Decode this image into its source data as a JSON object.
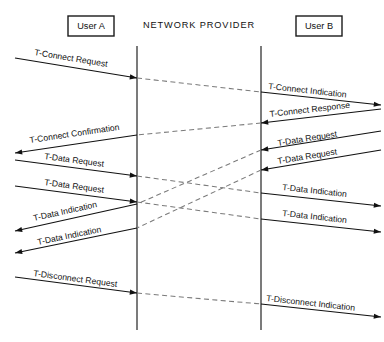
{
  "diagram": {
    "canvas": {
      "width": 384,
      "height": 342
    },
    "colors": {
      "line_solid": "#111111",
      "line_dashed": "#7a7a7a",
      "lifeline": "#5a5a5a",
      "box_stroke": "#1a1a1a",
      "background": "#ffffff"
    },
    "actors": [
      {
        "id": "user-a",
        "label": "User A",
        "box": {
          "x": 68,
          "y": 16,
          "w": 46,
          "h": 20
        }
      },
      {
        "id": "network-provider",
        "label": "NETWORK PROVIDER",
        "box": null,
        "center_x": 199,
        "center_y": 26
      },
      {
        "id": "user-b",
        "label": "User B",
        "box": {
          "x": 296,
          "y": 16,
          "w": 46,
          "h": 20
        }
      }
    ],
    "lifelines": [
      {
        "id": "provider-left-boundary",
        "x": 137,
        "y1": 46,
        "y2": 330
      },
      {
        "id": "provider-right-boundary",
        "x": 261,
        "y1": 46,
        "y2": 330
      }
    ],
    "messages": [
      {
        "id": "m1",
        "label": "T-Connect Request",
        "side": "left",
        "style": "solid",
        "direction": "to-provider",
        "x1": 15,
        "y1": 58,
        "x2": 137,
        "y2": 78,
        "label_x": 34,
        "label_y": 55,
        "label_rotate": 9.3
      },
      {
        "id": "m1d",
        "label": "",
        "side": "provider",
        "style": "dashed",
        "direction": "left-to-right",
        "x1": 137,
        "y1": 78,
        "x2": 261,
        "y2": 92
      },
      {
        "id": "m2",
        "label": "T-Connect Indication",
        "side": "right",
        "style": "solid",
        "direction": "to-user",
        "x1": 261,
        "y1": 92,
        "x2": 381,
        "y2": 105,
        "label_x": 268,
        "label_y": 89,
        "label_rotate": 6.2
      },
      {
        "id": "m3",
        "label": "T-Connect Response",
        "side": "right",
        "style": "solid",
        "direction": "to-provider",
        "x1": 381,
        "y1": 109,
        "x2": 261,
        "y2": 123,
        "label_x": 270,
        "label_y": 117,
        "label_rotate": -6.6
      },
      {
        "id": "m3d",
        "label": "",
        "side": "provider",
        "style": "dashed",
        "direction": "right-to-left",
        "x1": 261,
        "y1": 123,
        "x2": 137,
        "y2": 135
      },
      {
        "id": "m4",
        "label": "T-Connect Confirmation",
        "side": "left",
        "style": "solid",
        "direction": "to-user",
        "x1": 137,
        "y1": 135,
        "x2": 15,
        "y2": 153,
        "label_x": 30,
        "label_y": 143,
        "label_rotate": -8.4
      },
      {
        "id": "m5",
        "label": "T-Data Request",
        "side": "right",
        "style": "solid",
        "direction": "to-provider",
        "x1": 381,
        "y1": 131,
        "x2": 261,
        "y2": 150,
        "label_x": 278,
        "label_y": 146,
        "label_rotate": -9.0
      },
      {
        "id": "m6",
        "label": "T-Data Request",
        "side": "right",
        "style": "solid",
        "direction": "to-provider",
        "x1": 381,
        "y1": 150,
        "x2": 261,
        "y2": 170,
        "label_x": 278,
        "label_y": 164,
        "label_rotate": -9.3
      },
      {
        "id": "m7",
        "label": "T-Data Request",
        "side": "left",
        "style": "solid",
        "direction": "to-provider",
        "x1": 15,
        "y1": 160,
        "x2": 137,
        "y2": 176,
        "label_x": 44,
        "label_y": 159,
        "label_rotate": 7.5
      },
      {
        "id": "m8",
        "label": "T-Data Request",
        "side": "left",
        "style": "solid",
        "direction": "to-provider",
        "x1": 15,
        "y1": 186,
        "x2": 137,
        "y2": 202,
        "label_x": 44,
        "label_y": 185,
        "label_rotate": 7.5
      },
      {
        "id": "m5d",
        "label": "",
        "side": "provider",
        "style": "dashed",
        "direction": "right-to-left",
        "x1": 261,
        "y1": 150,
        "x2": 137,
        "y2": 204
      },
      {
        "id": "m6d",
        "label": "",
        "side": "provider",
        "style": "dashed",
        "direction": "right-to-left",
        "x1": 261,
        "y1": 170,
        "x2": 137,
        "y2": 228
      },
      {
        "id": "m7d",
        "label": "",
        "side": "provider",
        "style": "dashed",
        "direction": "left-to-right",
        "x1": 137,
        "y1": 176,
        "x2": 261,
        "y2": 193
      },
      {
        "id": "m8d",
        "label": "",
        "side": "provider",
        "style": "dashed",
        "direction": "left-to-right",
        "x1": 137,
        "y1": 202,
        "x2": 261,
        "y2": 219
      },
      {
        "id": "m9",
        "label": "T-Data Indication",
        "side": "right",
        "style": "solid",
        "direction": "to-user",
        "x1": 261,
        "y1": 193,
        "x2": 381,
        "y2": 206,
        "label_x": 282,
        "label_y": 190,
        "label_rotate": 6.2
      },
      {
        "id": "m10",
        "label": "T-Data Indication",
        "side": "right",
        "style": "solid",
        "direction": "to-user",
        "x1": 261,
        "y1": 219,
        "x2": 381,
        "y2": 232,
        "label_x": 282,
        "label_y": 216,
        "label_rotate": 6.2
      },
      {
        "id": "m11",
        "label": "T-Data Indication",
        "side": "left",
        "style": "solid",
        "direction": "to-user",
        "x1": 137,
        "y1": 204,
        "x2": 15,
        "y2": 231,
        "label_x": 34,
        "label_y": 221,
        "label_rotate": -12.5
      },
      {
        "id": "m12",
        "label": "T-Data Indication",
        "side": "left",
        "style": "solid",
        "direction": "to-user",
        "x1": 137,
        "y1": 228,
        "x2": 15,
        "y2": 253,
        "label_x": 38,
        "label_y": 245,
        "label_rotate": -11.6
      },
      {
        "id": "m13",
        "label": "T-Disconnect Request",
        "side": "left",
        "style": "solid",
        "direction": "to-provider",
        "x1": 15,
        "y1": 277,
        "x2": 137,
        "y2": 293,
        "label_x": 33,
        "label_y": 276,
        "label_rotate": 7.5
      },
      {
        "id": "m13d",
        "label": "",
        "side": "provider",
        "style": "dashed",
        "direction": "left-to-right",
        "x1": 137,
        "y1": 293,
        "x2": 261,
        "y2": 304
      },
      {
        "id": "m14",
        "label": "T-Disconnect Indication",
        "side": "right",
        "style": "solid",
        "direction": "to-user",
        "x1": 261,
        "y1": 304,
        "x2": 381,
        "y2": 317,
        "label_x": 266,
        "label_y": 301,
        "label_rotate": 6.2
      }
    ]
  }
}
